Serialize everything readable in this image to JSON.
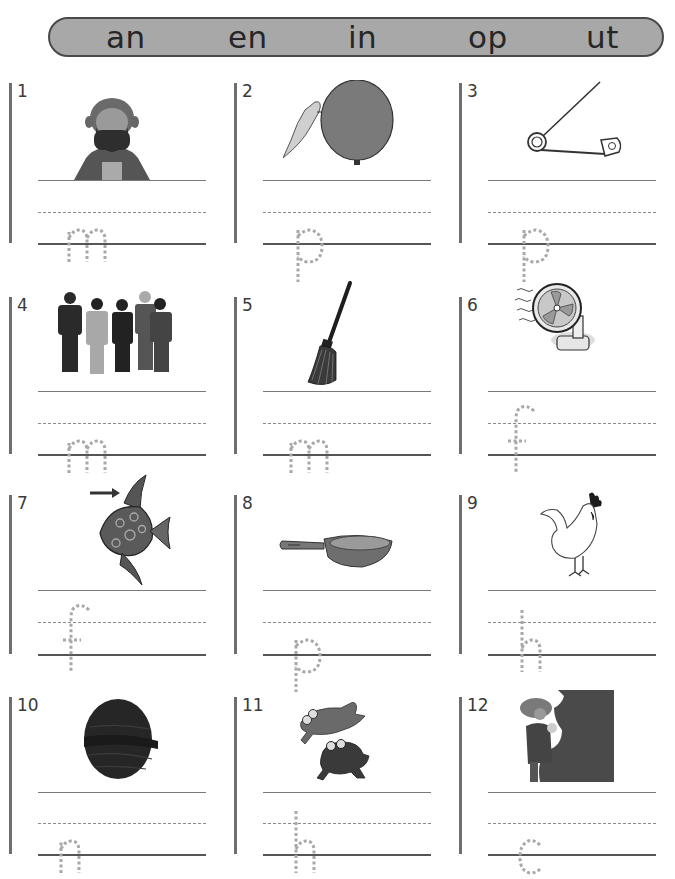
{
  "banner": {
    "words": [
      "an",
      "en",
      "in",
      "op",
      "ut"
    ]
  },
  "items": [
    {
      "number": "1",
      "picture": "man-with-beard",
      "start_letter": "m"
    },
    {
      "number": "2",
      "picture": "balloon-pin",
      "start_letter": "p"
    },
    {
      "number": "3",
      "picture": "safety-pin",
      "start_letter": "p"
    },
    {
      "number": "4",
      "picture": "group-of-men",
      "start_letter": "m"
    },
    {
      "number": "5",
      "picture": "mop",
      "start_letter": "m"
    },
    {
      "number": "6",
      "picture": "fan",
      "start_letter": "f"
    },
    {
      "number": "7",
      "picture": "fish-fin",
      "start_letter": "f"
    },
    {
      "number": "8",
      "picture": "pan",
      "start_letter": "p"
    },
    {
      "number": "9",
      "picture": "hen",
      "start_letter": "h"
    },
    {
      "number": "10",
      "picture": "nut",
      "start_letter": "n"
    },
    {
      "number": "11",
      "picture": "hopping-frogs",
      "start_letter": "h"
    },
    {
      "number": "12",
      "picture": "man-cutting",
      "start_letter": "c"
    }
  ],
  "colors": {
    "banner_fill": "#a8a8a8",
    "banner_border": "#4a4a4a",
    "trace_letter": "#a8a8a8",
    "rule_line": "#6e6e6e"
  }
}
